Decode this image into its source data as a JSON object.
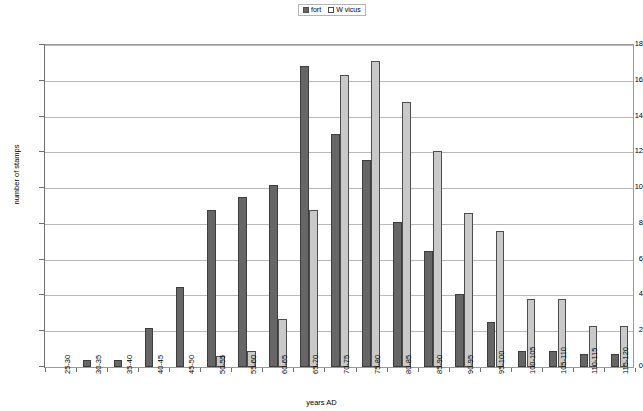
{
  "chart_data": {
    "type": "bar",
    "title": "",
    "xlabel": "years AD",
    "ylabel": "number of stamps",
    "ylim": [
      0,
      18
    ],
    "ytick_step": 2,
    "grid": true,
    "legend_position": "top-center",
    "categories": [
      "25-30",
      "30-35",
      "35-40",
      "40-45",
      "45-50",
      "50-55",
      "55-60",
      "60-65",
      "65-70",
      "70-75",
      "75-80",
      "80-85",
      "85-90",
      "90-95",
      "95-100",
      "100-105",
      "105-110",
      "110-115",
      "115-120"
    ],
    "series": [
      {
        "name": "fort",
        "color": "#666666",
        "values": [
          0,
          0.4,
          0.4,
          2.2,
          4.5,
          8.8,
          9.5,
          10.2,
          16.8,
          13.0,
          11.6,
          8.1,
          6.5,
          4.1,
          2.5,
          0.9,
          0.9,
          0.7,
          0.7
        ]
      },
      {
        "name": "W vicus",
        "color": "#c9c9c9",
        "values": [
          0,
          0,
          0,
          0,
          0,
          0.6,
          0.9,
          2.7,
          8.8,
          16.3,
          17.1,
          14.8,
          12.1,
          8.6,
          7.6,
          3.8,
          3.8,
          2.3,
          2.3
        ]
      }
    ],
    "ytick_labels": [
      "0",
      "2",
      "4",
      "6",
      "8",
      "10",
      "12",
      "14",
      "16",
      "18"
    ]
  },
  "legend": {
    "items": [
      {
        "label": "fort"
      },
      {
        "label": "W vicus"
      }
    ]
  }
}
